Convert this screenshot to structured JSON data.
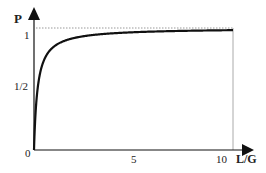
{
  "chart_data": {
    "type": "line",
    "title": "",
    "xlabel": "L/G",
    "ylabel": "P",
    "xlim": [
      0,
      10
    ],
    "ylim": [
      0,
      1
    ],
    "x_ticks": [
      "5",
      "10"
    ],
    "y_ticks": [
      "0",
      "1/2",
      "1"
    ],
    "grid": false,
    "legend": null,
    "annotations": [
      "dotted asymptote line at P = 1",
      "vertical reference line at L/G = 10"
    ],
    "series": [
      {
        "name": "P(L/G)",
        "x": [
          0,
          0.05,
          0.1,
          0.2,
          0.5,
          1,
          2,
          3,
          5,
          7,
          10
        ],
        "values": [
          0,
          0.22,
          0.36,
          0.53,
          0.74,
          0.85,
          0.92,
          0.94,
          0.965,
          0.975,
          0.983
        ]
      }
    ]
  },
  "axes": {
    "x_label": "L/G",
    "y_label": "P",
    "origin_label": "0",
    "x_tick_labels": [
      {
        "value": 5,
        "text": "5"
      },
      {
        "value": 10,
        "text": "10"
      }
    ],
    "y_tick_labels": [
      {
        "value": 0.5,
        "text": "1/2"
      },
      {
        "value": 1,
        "text": "1"
      }
    ]
  },
  "colors": {
    "axis": "#111111",
    "curve": "#111111",
    "reference": "#999999"
  }
}
